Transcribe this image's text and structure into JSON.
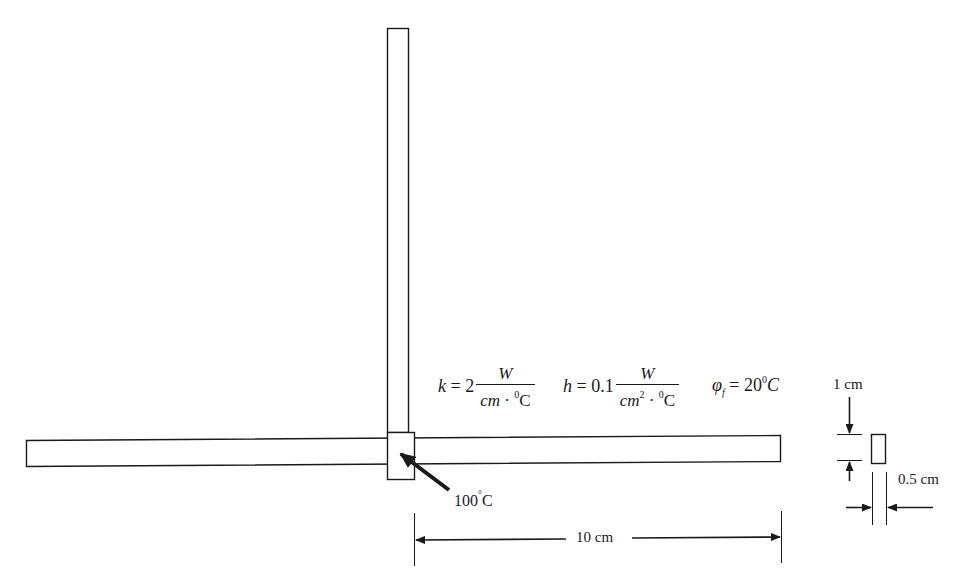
{
  "diagram": {
    "parameters": {
      "k": {
        "symbol": "k",
        "eq": "= 2",
        "num": "W",
        "den_base": "cm",
        "den_dot": "·",
        "den_unit_sup": "0",
        "den_unit": "C"
      },
      "h": {
        "symbol": "h",
        "eq": "= 0.1",
        "num": "W",
        "den_base": "cm",
        "den_base_sup": "2",
        "den_dot": "·",
        "den_unit_sup": "0",
        "den_unit": "C"
      },
      "phi": {
        "symbol": "φ",
        "sub": "f",
        "eq": "= 20",
        "sup": "0",
        "unit": "C"
      }
    },
    "base_temperature": {
      "value": "100",
      "sup": "°",
      "unit": "C"
    },
    "dimensions": {
      "length": "10 cm",
      "height": "1 cm",
      "thickness": "0.5 cm"
    },
    "colors": {
      "stroke": "#1a1a1a",
      "background": "#ffffff"
    }
  }
}
